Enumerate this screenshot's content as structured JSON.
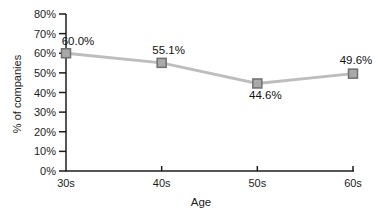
{
  "chart_data": {
    "type": "line",
    "title": "",
    "xlabel": "Age",
    "ylabel": "% of companies",
    "categories": [
      "30s",
      "40s",
      "50s",
      "60s"
    ],
    "series": [
      {
        "name": "% of companies",
        "values": [
          60.0,
          55.1,
          44.6,
          49.6
        ]
      }
    ],
    "point_labels": [
      "60.0%",
      "55.1%",
      "44.6%",
      "49.6%"
    ],
    "point_label_offsets": [
      [
        12,
        -8
      ],
      [
        7,
        -9
      ],
      [
        8,
        16
      ],
      [
        3,
        -10
      ]
    ],
    "ylim": [
      0,
      80
    ],
    "ytick_step": 10,
    "ytick_labels": [
      "0%",
      "10%",
      "20%",
      "30%",
      "40%",
      "50%",
      "60%",
      "70%",
      "80%"
    ],
    "grid": false,
    "legend": "none",
    "marker": "square",
    "colors": {
      "line": "#bdbdbd",
      "marker_fill": "#a9a9a9",
      "marker_border": "#707070",
      "axis": "#1c1c1c",
      "text": "#1c1c1c",
      "background": "#ffffff"
    }
  }
}
